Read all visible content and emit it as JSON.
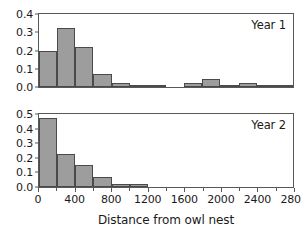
{
  "chart_data": {
    "type": "bar",
    "title": "",
    "subtitle": "",
    "xlabel": "Distance from owl nest",
    "ylabel": "",
    "grid": false,
    "legend_position": "inside-top-right",
    "bin_width": 200,
    "xlim": [
      0,
      2800
    ],
    "x_major_ticks": [
      0,
      400,
      800,
      1200,
      1600,
      2000,
      2400,
      2800
    ],
    "x_minor_ticks": [
      200,
      600,
      1000,
      1400,
      1800,
      2200,
      2600
    ],
    "x_tick_labels": [
      "0",
      "400",
      "800",
      "1200",
      "1600",
      "2000",
      "2400",
      "2800"
    ],
    "bar_color": "#9d9d9d",
    "bar_edge_color": "#4a4a4a",
    "axis_color": "#585858",
    "panels": [
      {
        "name": "Year 1",
        "label": "Year 1",
        "ylim": [
          0.0,
          0.4
        ],
        "y_ticks": [
          0.0,
          0.1,
          0.2,
          0.3,
          0.4
        ],
        "y_tick_labels": [
          "0.0",
          "0.1",
          "0.2",
          "0.3",
          "0.4"
        ],
        "bin_starts": [
          0,
          200,
          400,
          600,
          800,
          1000,
          1200,
          1400,
          1600,
          1800,
          2000,
          2200,
          2400,
          2600
        ],
        "values": [
          0.2,
          0.322,
          0.222,
          0.072,
          0.02,
          0.005,
          0.005,
          0.0,
          0.02,
          0.043,
          0.005,
          0.02,
          0.01,
          0.003
        ]
      },
      {
        "name": "Year 2",
        "label": "Year 2",
        "ylim": [
          0.0,
          0.5
        ],
        "y_ticks": [
          0.0,
          0.1,
          0.2,
          0.3,
          0.4,
          0.5
        ],
        "y_tick_labels": [
          "0.0",
          "0.1",
          "0.2",
          "0.3",
          "0.4",
          "0.5"
        ],
        "bin_starts": [
          0,
          200,
          400,
          600,
          800,
          1000,
          1200,
          1400,
          1600,
          1800,
          2000,
          2200,
          2400,
          2600
        ],
        "values": [
          0.472,
          0.224,
          0.15,
          0.072,
          0.02,
          0.02,
          0.0,
          0.0,
          0.0,
          0.0,
          0.0,
          0.0,
          0.0,
          0.0
        ]
      }
    ]
  }
}
